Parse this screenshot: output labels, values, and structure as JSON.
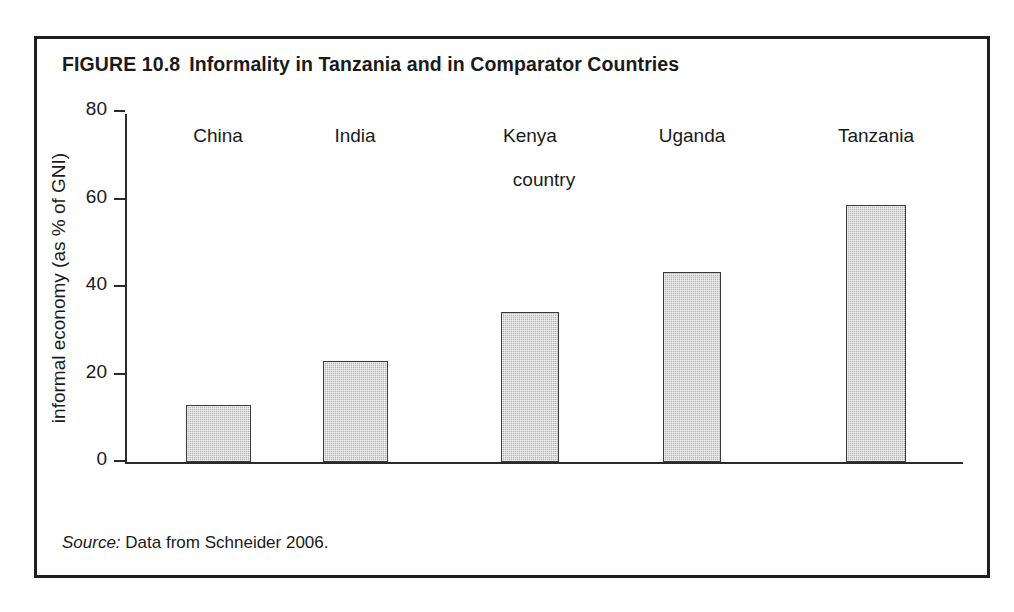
{
  "figure": {
    "number": "FIGURE 10.8",
    "title": "Informality in Tanzania and in Comparator Countries",
    "source_label": "Source:",
    "source_text": "Data from Schneider 2006."
  },
  "chart_data": {
    "type": "bar",
    "categories": [
      "China",
      "India",
      "Kenya",
      "Uganda",
      "Tanzania"
    ],
    "values": [
      13.1,
      23.2,
      34.3,
      43.4,
      58.8
    ],
    "series": [
      {
        "name": "informal economy (as % of GNI)",
        "values": [
          13.1,
          23.2,
          34.3,
          43.4,
          58.8
        ]
      }
    ],
    "xlabel": "country",
    "ylabel": "informal economy (as % of GNI)",
    "ylim": [
      0,
      80
    ],
    "yticks": [
      0,
      20,
      40,
      60,
      80
    ],
    "ytick_labels": [
      "0",
      "20",
      "40",
      "60",
      "80"
    ],
    "grid": false,
    "legend": false,
    "bar_fill_color": "#b4b4b4",
    "bar_edge_color": "#3a3a3a",
    "axis_color": "#2b2b2b",
    "background_color": "#ffffff"
  }
}
